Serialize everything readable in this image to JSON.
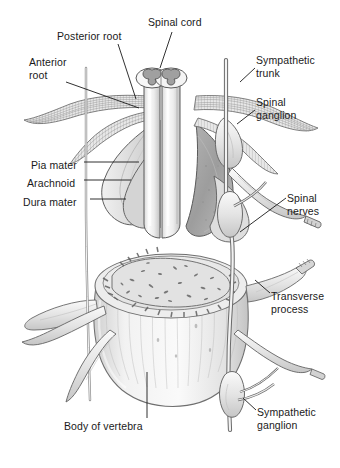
{
  "figure": {
    "background_color": "#ffffff",
    "style": "grayscale pen-and-ink anatomical illustration"
  },
  "labels": [
    {
      "id": "spinal-cord",
      "text": "Spinal cord",
      "x": 148,
      "y": 16,
      "align": "left"
    },
    {
      "id": "posterior-root",
      "text": "Posterior root",
      "x": 57,
      "y": 30,
      "align": "left"
    },
    {
      "id": "anterior-root",
      "text": "Anterior\nroot",
      "x": 29,
      "y": 56,
      "align": "left"
    },
    {
      "id": "sympathetic-trunk",
      "text": "Sympathetic\ntrunk",
      "x": 256,
      "y": 54,
      "align": "left"
    },
    {
      "id": "spinal-ganglion",
      "text": "Spinal\nganglion",
      "x": 256,
      "y": 96,
      "align": "left"
    },
    {
      "id": "pia-mater",
      "text": "Pia mater",
      "x": 31,
      "y": 159,
      "align": "left"
    },
    {
      "id": "arachnoid",
      "text": "Arachnoid",
      "x": 27,
      "y": 177,
      "align": "left"
    },
    {
      "id": "dura-mater",
      "text": "Dura mater",
      "x": 23,
      "y": 196,
      "align": "left"
    },
    {
      "id": "spinal-nerves",
      "text": "Spinal\nnerves",
      "x": 287,
      "y": 192,
      "align": "left"
    },
    {
      "id": "transverse-process",
      "text": "Transverse\nprocess",
      "x": 271,
      "y": 290,
      "align": "left"
    },
    {
      "id": "body-of-vertebra",
      "text": "Body of vertebra",
      "x": 64,
      "y": 420,
      "align": "left"
    },
    {
      "id": "sympathetic-ganglion",
      "text": "Sympathetic\nganglion",
      "x": 257,
      "y": 406,
      "align": "left"
    }
  ],
  "leaders": [
    {
      "id": "leader-spinal-cord",
      "path": "M172,32 L160,68"
    },
    {
      "id": "leader-posterior-root",
      "path": "M118,44 L136,99"
    },
    {
      "id": "leader-anterior-root",
      "path": "M66,82 L139,108"
    },
    {
      "id": "leader-sympathetic-trunk",
      "path": "M255,68 L240,82"
    },
    {
      "id": "leader-spinal-ganglion",
      "path": "M255,110 L237,124"
    },
    {
      "id": "leader-pia-mater",
      "path": "M84,162 L139,162"
    },
    {
      "id": "leader-arachnoid",
      "path": "M84,180 L131,180"
    },
    {
      "id": "leader-dura-mater",
      "path": "M90,199 L126,199"
    },
    {
      "id": "leader-spinal-nerves",
      "path": "M286,198 L240,232"
    },
    {
      "id": "leader-transverse-process",
      "path": "M270,293 L255,280"
    },
    {
      "id": "leader-body-of-vertebra",
      "path": "M147,418 L147,372"
    },
    {
      "id": "leader-sympathetic-ganglion",
      "path": "M256,410 L243,398"
    }
  ],
  "colors": {
    "ink": "#3f3f3f",
    "ink_light": "#8a8a8a",
    "fill_pale": "#f4f4f4",
    "fill_light": "#e6e6e6",
    "fill_mid": "#c9c9c9",
    "fill_dark": "#a8a8a8",
    "fill_deep": "#8e8e8e",
    "text": "#1a1a1a"
  },
  "structures": [
    {
      "id": "spinal-cord-cylinder",
      "name": "Spinal cord (cut cylinder with gray matter)"
    },
    {
      "id": "gray-matter-butterfly",
      "name": "Butterfly-shaped gray matter"
    },
    {
      "id": "dura-mater-sheet",
      "name": "Dura mater opened sheet"
    },
    {
      "id": "arachnoid-sheet",
      "name": "Arachnoid membrane layer"
    },
    {
      "id": "pia-mater-layer",
      "name": "Pia mater on cord surface"
    },
    {
      "id": "nerve-root-bundles",
      "name": "Anterior and posterior root fiber bundles"
    },
    {
      "id": "spinal-ganglion-swell",
      "name": "Spinal (dorsal root) ganglion swelling"
    },
    {
      "id": "sympathetic-trunk-chain",
      "name": "Sympathetic trunk vertical chain"
    },
    {
      "id": "sympathetic-ganglia",
      "name": "Sympathetic ganglia along trunk"
    },
    {
      "id": "vertebral-body",
      "name": "Body of vertebra with cancellous bone"
    },
    {
      "id": "transverse-process-arm",
      "name": "Transverse process"
    },
    {
      "id": "spinal-nerve-branches",
      "name": "Spinal nerve branches"
    }
  ]
}
